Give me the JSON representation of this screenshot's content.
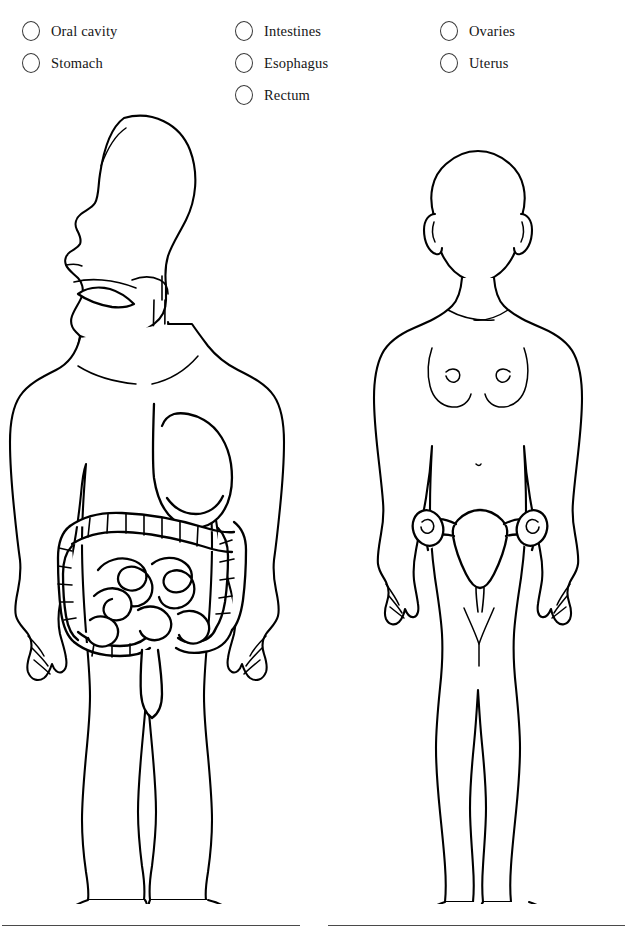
{
  "options": {
    "columns": [
      {
        "column_name": "digestive-upper",
        "items": [
          {
            "label": "Oral cavity",
            "marker": "radio-circle-unselected",
            "selected": false
          },
          {
            "label": "Stomach",
            "marker": "radio-circle-unselected",
            "selected": false
          }
        ]
      },
      {
        "column_name": "digestive-lower",
        "items": [
          {
            "label": "Intestines",
            "marker": "radio-circle-unselected",
            "selected": false
          },
          {
            "label": "Esophagus",
            "marker": "radio-circle-unselected",
            "selected": false
          },
          {
            "label": "Rectum",
            "marker": "radio-circle-unselected",
            "selected": false
          }
        ]
      },
      {
        "column_name": "reproductive",
        "items": [
          {
            "label": "Ovaries",
            "marker": "radio-circle-unselected",
            "selected": false
          },
          {
            "label": "Uterus",
            "marker": "radio-circle-unselected",
            "selected": false
          }
        ]
      }
    ]
  },
  "figures": {
    "male": {
      "name": "male-anatomy-figure",
      "view": "profile head, frontal body",
      "organs_shown": [
        "oral cavity",
        "esophagus",
        "stomach",
        "large intestine",
        "small intestine",
        "rectum"
      ]
    },
    "female": {
      "name": "female-anatomy-figure",
      "view": "frontal",
      "organs_shown": [
        "uterus",
        "fallopian tubes",
        "ovaries"
      ]
    }
  },
  "colors": {
    "background": "#ffffff",
    "outline": "#000000",
    "marker_stroke": "#3a3a3a",
    "rule": "#4a4a4a",
    "text": "#161616"
  }
}
